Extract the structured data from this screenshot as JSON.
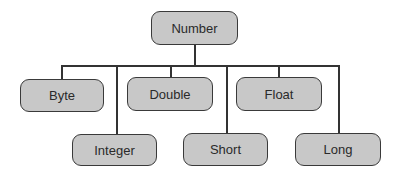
{
  "diagram": {
    "type": "class-hierarchy-tree",
    "root": {
      "label": "Number"
    },
    "children": [
      {
        "label": "Byte",
        "row": 1
      },
      {
        "label": "Integer",
        "row": 2
      },
      {
        "label": "Double",
        "row": 1
      },
      {
        "label": "Short",
        "row": 2
      },
      {
        "label": "Float",
        "row": 1
      },
      {
        "label": "Long",
        "row": 2
      }
    ],
    "colors": {
      "node_fill": "#c8c8c8",
      "node_border": "#3a3a3a",
      "line": "#333333"
    }
  }
}
